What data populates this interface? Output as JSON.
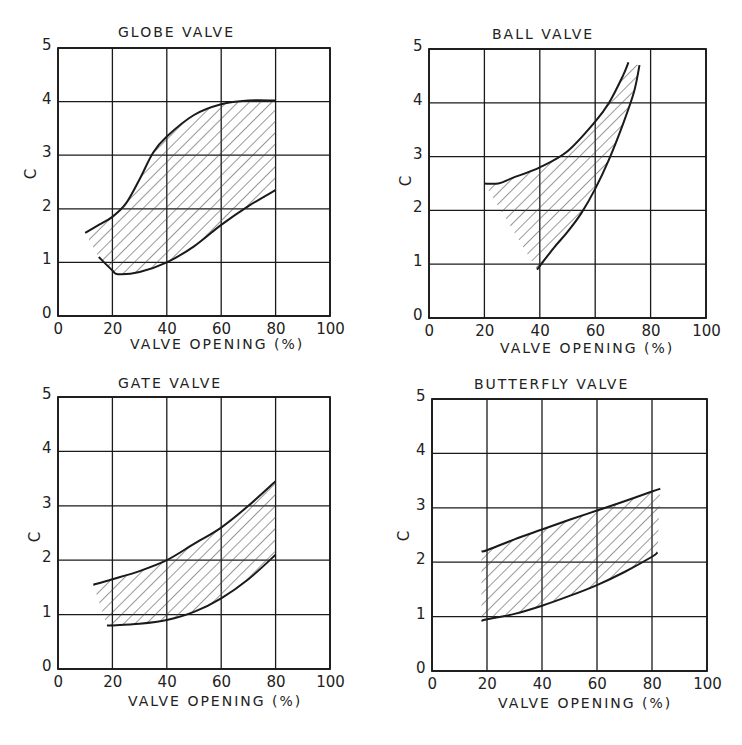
{
  "chart_data": [
    {
      "type": "area",
      "title": "GLOBE VALVE",
      "xlabel": "VALVE OPENING (%)",
      "ylabel": "C",
      "xlim": [
        0,
        100
      ],
      "ylim": [
        0,
        5
      ],
      "xticks": [
        "0",
        "20",
        "40",
        "60",
        "80",
        "100"
      ],
      "yticks": [
        "0",
        "1",
        "2",
        "3",
        "4",
        "5"
      ],
      "grid": true,
      "fill": "hatched band",
      "series": [
        {
          "name": "upper bound",
          "x": [
            10,
            15,
            20,
            25,
            30,
            35,
            40,
            50,
            60,
            70,
            80
          ],
          "values": [
            1.55,
            1.7,
            1.85,
            2.1,
            2.55,
            3.05,
            3.35,
            3.75,
            3.95,
            4.02,
            4.02
          ]
        },
        {
          "name": "lower bound",
          "x": [
            15,
            20,
            22,
            30,
            40,
            50,
            60,
            70,
            80
          ],
          "values": [
            1.1,
            0.85,
            0.78,
            0.82,
            1.0,
            1.3,
            1.7,
            2.05,
            2.35
          ]
        }
      ]
    },
    {
      "type": "area",
      "title": "BALL VALVE",
      "xlabel": "VALVE OPENING (%)",
      "ylabel": "C",
      "xlim": [
        0,
        100
      ],
      "ylim": [
        0,
        5
      ],
      "xticks": [
        "0",
        "20",
        "40",
        "60",
        "80",
        "100"
      ],
      "yticks": [
        "0",
        "1",
        "2",
        "3",
        "4",
        "5"
      ],
      "grid": true,
      "fill": "hatched band",
      "series": [
        {
          "name": "upper bound",
          "x": [
            20,
            25,
            30,
            40,
            50,
            60,
            65,
            70,
            72
          ],
          "values": [
            2.5,
            2.5,
            2.6,
            2.8,
            3.1,
            3.65,
            4.0,
            4.5,
            4.75
          ]
        },
        {
          "name": "lower bound",
          "x": [
            39,
            45,
            50,
            55,
            60,
            65,
            70,
            74,
            76
          ],
          "values": [
            0.9,
            1.3,
            1.6,
            1.95,
            2.4,
            2.95,
            3.6,
            4.2,
            4.7
          ]
        }
      ]
    },
    {
      "type": "area",
      "title": "GATE VALVE",
      "xlabel": "VALVE OPENING (%)",
      "ylabel": "C",
      "xlim": [
        0,
        100
      ],
      "ylim": [
        0,
        5
      ],
      "xticks": [
        "0",
        "20",
        "40",
        "60",
        "80",
        "100"
      ],
      "yticks": [
        "0",
        "1",
        "2",
        "3",
        "4",
        "5"
      ],
      "grid": true,
      "fill": "hatched band",
      "series": [
        {
          "name": "upper bound",
          "x": [
            13,
            20,
            30,
            40,
            50,
            60,
            70,
            80
          ],
          "values": [
            1.55,
            1.65,
            1.8,
            2.0,
            2.3,
            2.6,
            3.0,
            3.45
          ]
        },
        {
          "name": "lower bound",
          "x": [
            18,
            20,
            30,
            40,
            50,
            60,
            70,
            80
          ],
          "values": [
            0.8,
            0.8,
            0.83,
            0.9,
            1.05,
            1.3,
            1.65,
            2.1
          ]
        }
      ]
    },
    {
      "type": "area",
      "title": "BUTTERFLY VALVE",
      "xlabel": "VALVE OPENING (%)",
      "ylabel": "C",
      "xlim": [
        0,
        100
      ],
      "ylim": [
        0,
        5
      ],
      "xticks": [
        "0",
        "20",
        "40",
        "60",
        "80",
        "100"
      ],
      "yticks": [
        "0",
        "1",
        "2",
        "3",
        "4",
        "5"
      ],
      "grid": true,
      "fill": "hatched band",
      "series": [
        {
          "name": "upper bound",
          "x": [
            18,
            20,
            30,
            40,
            50,
            60,
            70,
            80,
            83
          ],
          "values": [
            2.2,
            2.22,
            2.42,
            2.6,
            2.78,
            2.95,
            3.12,
            3.3,
            3.35
          ]
        },
        {
          "name": "lower bound",
          "x": [
            18,
            20,
            30,
            40,
            50,
            60,
            70,
            80,
            82
          ],
          "values": [
            0.92,
            0.95,
            1.05,
            1.2,
            1.38,
            1.58,
            1.82,
            2.1,
            2.18
          ]
        }
      ]
    }
  ],
  "panels": [
    {
      "title": "GLOBE VALVE",
      "xlabel": "VALVE OPENING (%)",
      "ylabel": "C"
    },
    {
      "title": "BALL VALVE",
      "xlabel": "VALVE OPENING (%)",
      "ylabel": "C"
    },
    {
      "title": "GATE VALVE",
      "xlabel": "VALVE OPENING (%)",
      "ylabel": "C"
    },
    {
      "title": "BUTTERFLY VALVE",
      "xlabel": "VALVE OPENING (%)",
      "ylabel": "C"
    }
  ],
  "colors": {
    "ink": "#1a1a1a",
    "grid": "#222222",
    "hatch": "#444444",
    "background": "#ffffff"
  }
}
